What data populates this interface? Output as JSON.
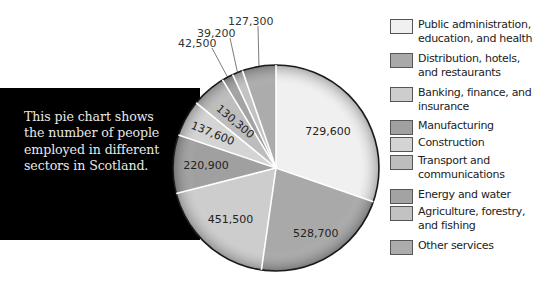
{
  "caption": {
    "text": "This pie chart shows the number of people employed in different sectors in Scotland."
  },
  "chart_data": {
    "type": "pie",
    "title": "",
    "description": "This pie chart shows the number of people employed in different sectors in Scotland.",
    "categories": [
      "Public administration, education, and health",
      "Distribution, hotels, and restaurants",
      "Banking, finance, and insurance",
      "Manufacturing",
      "Construction",
      "Transport and communications",
      "Energy and water",
      "Agriculture, forestry, and fishing",
      "Other services"
    ],
    "values": [
      729600,
      528700,
      451500,
      220900,
      137600,
      130300,
      42500,
      39200,
      127300
    ],
    "value_labels": [
      "729,600",
      "528,700",
      "451,500",
      "220,900",
      "137,600",
      "130,300",
      "42,500",
      "39,200",
      "127,300"
    ],
    "colors": [
      "#f0f0f0",
      "#a9a9a9",
      "#cdcdcd",
      "#a0a0a0",
      "#d4d4d4",
      "#bdbdbd",
      "#a3a3a3",
      "#c2c2c2",
      "#acacac"
    ],
    "start_angle": "top, clockwise",
    "legend_position": "right"
  },
  "legend": {
    "items": [
      {
        "label_lines": [
          "Public administration,",
          "education, and health"
        ],
        "color": "#f0f0f0"
      },
      {
        "label_lines": [
          "Distribution, hotels,",
          "and restaurants"
        ],
        "color": "#a9a9a9"
      },
      {
        "label_lines": [
          "Banking, finance, and",
          "insurance"
        ],
        "color": "#cdcdcd"
      },
      {
        "label_lines": [
          "Manufacturing"
        ],
        "color": "#a0a0a0"
      },
      {
        "label_lines": [
          "Construction"
        ],
        "color": "#d4d4d4"
      },
      {
        "label_lines": [
          "Transport and",
          "communications"
        ],
        "color": "#bdbdbd"
      },
      {
        "label_lines": [
          "Energy and water"
        ],
        "color": "#a3a3a3"
      },
      {
        "label_lines": [
          "Agriculture, forestry,",
          "and fishing"
        ],
        "color": "#c2c2c2"
      },
      {
        "label_lines": [
          "Other services"
        ],
        "color": "#acacac"
      }
    ]
  }
}
